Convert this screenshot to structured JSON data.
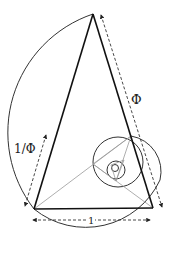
{
  "diagram": {
    "labels": {
      "long_side": "Φ",
      "short_side": "1/Φ",
      "base": "1"
    },
    "colors": {
      "background": "#ffffff",
      "thick_line": "#111111",
      "thin_line": "#999999",
      "arc": "#333333",
      "dashed": "#333333"
    }
  }
}
